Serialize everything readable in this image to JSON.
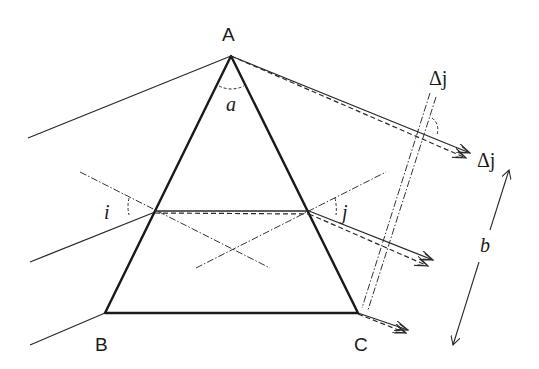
{
  "diagram": {
    "type": "prism-dispersion",
    "vertices": {
      "A": {
        "label": "A",
        "x": 231,
        "y": 56
      },
      "B": {
        "label": "B",
        "x": 105,
        "y": 313
      },
      "C": {
        "label": "C",
        "x": 358,
        "y": 313
      }
    },
    "angle_labels": {
      "apex": "a",
      "incidence": "i",
      "emergence": "j"
    },
    "delta_labels": {
      "upper": "Δj",
      "right": "Δj"
    },
    "dimension_label": "b",
    "colors": {
      "stroke": "#1a1a1a",
      "background": "#ffffff"
    }
  }
}
